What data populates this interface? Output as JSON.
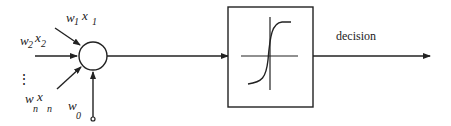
{
  "diagram": {
    "type": "perceptron",
    "inputs": [
      {
        "weight": "w",
        "weight_sub": "1",
        "input": "x",
        "input_sub": "1"
      },
      {
        "weight": "w",
        "weight_sub": "2",
        "input": "x",
        "input_sub": "2"
      },
      {
        "weight": "w",
        "weight_sub": "n",
        "input": "x",
        "input_sub": "n"
      }
    ],
    "ellipsis": "⋮",
    "bias": {
      "weight": "w",
      "weight_sub": "0"
    },
    "summation_node": "circle",
    "activation": "sigmoid",
    "output_label": "decision",
    "stroke_color": "#222222"
  }
}
